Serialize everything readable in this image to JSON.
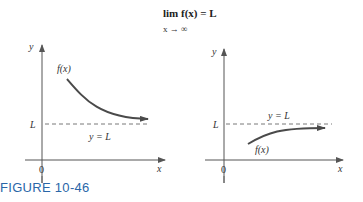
{
  "title": {
    "line1": "lim f(x) = L",
    "line2": "x → ∞"
  },
  "left_graph": {
    "y_axis_label": "y",
    "x_axis_label": "x",
    "origin_label": "0",
    "asymptote_tick_label": "L",
    "asymptote_label": "y = L",
    "curve_label": "f(x)",
    "description": "f(x) decreasing toward L from above"
  },
  "right_graph": {
    "y_axis_label": "y",
    "x_axis_label": "x",
    "origin_label": "0",
    "asymptote_tick_label": "L",
    "asymptote_label": "y = L",
    "curve_label": "f(x)",
    "description": "f(x) increasing toward L from below"
  },
  "caption": "FIGURE 10-46",
  "colors": {
    "curve": "#4a4a4a",
    "axes": "#555555",
    "caption": "#2a66a8"
  }
}
